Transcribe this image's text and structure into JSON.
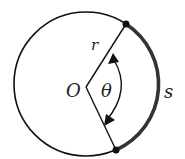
{
  "diagram": {
    "type": "circle-arc-length",
    "labels": {
      "center": "O",
      "radius": "r",
      "angle": "θ",
      "arc": "s"
    },
    "circle": {
      "cx": 86,
      "cy": 84,
      "r": 72
    },
    "center_point": {
      "x": 86,
      "y": 87
    },
    "arc_endpoints": [
      {
        "x": 126,
        "y": 24
      },
      {
        "x": 116,
        "y": 150
      }
    ],
    "colors": {
      "stroke": "#111111",
      "arc_highlight": "#333333",
      "background": "#ffffff"
    }
  }
}
